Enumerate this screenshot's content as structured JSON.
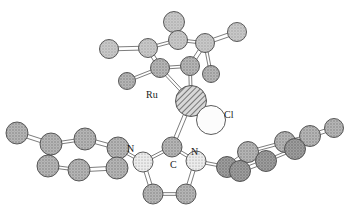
{
  "figure": {
    "type": "ball-and-stick crystal structure diagram",
    "background_color": "#ffffff",
    "bond_color": "#6e6e6e",
    "outline_color": "#4a4a4a"
  },
  "labels": {
    "ru": "Ru",
    "cl": "Cl",
    "n_left": "N",
    "c_carbene": "C",
    "n_right": "N"
  },
  "label_positions": {
    "ru": {
      "x": 146,
      "y": 90
    },
    "cl": {
      "x": 224,
      "y": 110
    },
    "n_left": {
      "x": 127,
      "y": 144
    },
    "c_carbene": {
      "x": 170,
      "y": 160
    },
    "n_right": {
      "x": 191,
      "y": 147
    }
  },
  "styles": {
    "ru_fill": "#cfcfcf",
    "ru_pattern": "diagonal-hatch",
    "cl_fill": "#fbfbfb",
    "cl_pattern": "plain",
    "n_fill": "#e3e3e3",
    "n_pattern": "fine-stipple",
    "c_fill": "#a8a8a8",
    "c_pattern": "coarse-stipple",
    "c_fill_light": "#c2c2c2"
  },
  "atoms": [
    {
      "id": "ru1",
      "element": "Ru",
      "x": 191,
      "y": 101,
      "r": 15.5,
      "style": "ru",
      "labelled": true
    },
    {
      "id": "cl1",
      "element": "Cl",
      "x": 211,
      "y": 120,
      "r": 14.5,
      "style": "cl",
      "labelled": true
    },
    {
      "id": "cy1",
      "element": "C",
      "x": 178,
      "y": 40,
      "r": 9.5,
      "style": "c_light",
      "labelled": false
    },
    {
      "id": "cy2",
      "element": "C",
      "x": 205,
      "y": 43,
      "r": 9.5,
      "style": "c_light",
      "labelled": false
    },
    {
      "id": "cy3",
      "element": "C",
      "x": 190,
      "y": 66,
      "r": 9.5,
      "style": "c_mid",
      "labelled": false
    },
    {
      "id": "cy4",
      "element": "C",
      "x": 160,
      "y": 68,
      "r": 9.5,
      "style": "c_mid",
      "labelled": false
    },
    {
      "id": "cy5",
      "element": "C",
      "x": 148,
      "y": 48,
      "r": 9.5,
      "style": "c_light",
      "labelled": false
    },
    {
      "id": "cy6",
      "element": "C",
      "x": 174,
      "y": 22,
      "r": 10.5,
      "style": "c_light",
      "labelled": false
    },
    {
      "id": "cy7",
      "element": "C",
      "x": 109,
      "y": 49,
      "r": 9.5,
      "style": "c_light",
      "labelled": false
    },
    {
      "id": "cy8",
      "element": "C",
      "x": 237,
      "y": 32,
      "r": 9.5,
      "style": "c_light",
      "labelled": false
    },
    {
      "id": "cy9",
      "element": "C",
      "x": 211,
      "y": 74,
      "r": 8.5,
      "style": "c_mid",
      "labelled": false
    },
    {
      "id": "cy10",
      "element": "C",
      "x": 127,
      "y": 81,
      "r": 8.5,
      "style": "c_mid",
      "labelled": false
    },
    {
      "id": "cb1",
      "element": "C",
      "x": 172,
      "y": 147,
      "r": 10.0,
      "style": "c_mid",
      "labelled": true
    },
    {
      "id": "nl1",
      "element": "N",
      "x": 143,
      "y": 162,
      "r": 10.0,
      "style": "n",
      "labelled": true
    },
    {
      "id": "nr1",
      "element": "N",
      "x": 196,
      "y": 161,
      "r": 10.0,
      "style": "n",
      "labelled": true
    },
    {
      "id": "im1",
      "element": "C",
      "x": 153,
      "y": 194,
      "r": 10.0,
      "style": "c_mid",
      "labelled": false
    },
    {
      "id": "im2",
      "element": "C",
      "x": 186,
      "y": 194,
      "r": 10.0,
      "style": "c_mid",
      "labelled": false
    },
    {
      "id": "ar1",
      "element": "C",
      "x": 118,
      "y": 148,
      "r": 11.0,
      "style": "c_mid",
      "labelled": false
    },
    {
      "id": "ar2",
      "element": "C",
      "x": 117,
      "y": 168,
      "r": 11.0,
      "style": "c_mid",
      "labelled": false
    },
    {
      "id": "ar3",
      "element": "C",
      "x": 85,
      "y": 139,
      "r": 11.0,
      "style": "c_mid",
      "labelled": false
    },
    {
      "id": "ar4",
      "element": "C",
      "x": 79,
      "y": 170,
      "r": 11.0,
      "style": "c_mid",
      "labelled": false
    },
    {
      "id": "ar5",
      "element": "C",
      "x": 51,
      "y": 144,
      "r": 11.0,
      "style": "c_mid",
      "labelled": false
    },
    {
      "id": "ar6",
      "element": "C",
      "x": 48,
      "y": 166,
      "r": 11.0,
      "style": "c_mid",
      "labelled": false
    },
    {
      "id": "ar7",
      "element": "C",
      "x": 17,
      "y": 133,
      "r": 11.0,
      "style": "c_mid",
      "labelled": false
    },
    {
      "id": "br1",
      "element": "C",
      "x": 227,
      "y": 167,
      "r": 10.5,
      "style": "c_dark",
      "labelled": false
    },
    {
      "id": "br2",
      "element": "C",
      "x": 240,
      "y": 171,
      "r": 10.5,
      "style": "c_dark",
      "labelled": false
    },
    {
      "id": "br3",
      "element": "C",
      "x": 248,
      "y": 152,
      "r": 10.5,
      "style": "c_mid",
      "labelled": false
    },
    {
      "id": "br4",
      "element": "C",
      "x": 266,
      "y": 161,
      "r": 10.5,
      "style": "c_dark",
      "labelled": false
    },
    {
      "id": "br5",
      "element": "C",
      "x": 285,
      "y": 142,
      "r": 10.5,
      "style": "c_mid",
      "labelled": false
    },
    {
      "id": "br6",
      "element": "C",
      "x": 295,
      "y": 149,
      "r": 10.5,
      "style": "c_dark",
      "labelled": false
    },
    {
      "id": "br7",
      "element": "C",
      "x": 310,
      "y": 136,
      "r": 10.5,
      "style": "c_mid",
      "labelled": false
    },
    {
      "id": "br8",
      "element": "C",
      "x": 334,
      "y": 128,
      "r": 9.5,
      "style": "c_mid",
      "labelled": false
    }
  ],
  "bonds": [
    {
      "from": "ru1",
      "to": "cb1",
      "order": "double"
    },
    {
      "from": "ru1",
      "to": "cl1",
      "order": "single"
    },
    {
      "from": "ru1",
      "to": "cy4",
      "order": "single"
    },
    {
      "from": "ru1",
      "to": "cy3",
      "order": "single"
    },
    {
      "from": "cy1",
      "to": "cy2",
      "order": "single"
    },
    {
      "from": "cy2",
      "to": "cy3",
      "order": "double"
    },
    {
      "from": "cy3",
      "to": "cy4",
      "order": "single"
    },
    {
      "from": "cy4",
      "to": "cy5",
      "order": "double"
    },
    {
      "from": "cy5",
      "to": "cy1",
      "order": "single"
    },
    {
      "from": "cy1",
      "to": "cy6",
      "order": "single"
    },
    {
      "from": "cy5",
      "to": "cy7",
      "order": "double"
    },
    {
      "from": "cy2",
      "to": "cy8",
      "order": "double"
    },
    {
      "from": "cy2",
      "to": "cy9",
      "order": "single"
    },
    {
      "from": "cy4",
      "to": "cy10",
      "order": "single"
    },
    {
      "from": "cb1",
      "to": "nl1",
      "order": "single"
    },
    {
      "from": "cb1",
      "to": "nr1",
      "order": "single"
    },
    {
      "from": "nl1",
      "to": "im1",
      "order": "double"
    },
    {
      "from": "im1",
      "to": "im2",
      "order": "single"
    },
    {
      "from": "im2",
      "to": "nr1",
      "order": "double"
    },
    {
      "from": "nl1",
      "to": "ar1",
      "order": "single"
    },
    {
      "from": "ar1",
      "to": "ar2",
      "order": "single"
    },
    {
      "from": "ar1",
      "to": "ar3",
      "order": "double"
    },
    {
      "from": "ar2",
      "to": "ar4",
      "order": "double"
    },
    {
      "from": "ar3",
      "to": "ar5",
      "order": "single"
    },
    {
      "from": "ar4",
      "to": "ar6",
      "order": "single"
    },
    {
      "from": "ar5",
      "to": "ar6",
      "order": "double"
    },
    {
      "from": "ar5",
      "to": "ar7",
      "order": "double"
    },
    {
      "from": "nr1",
      "to": "br1",
      "order": "single"
    },
    {
      "from": "br1",
      "to": "br2",
      "order": "single"
    },
    {
      "from": "br1",
      "to": "br3",
      "order": "double"
    },
    {
      "from": "br2",
      "to": "br4",
      "order": "double"
    },
    {
      "from": "br3",
      "to": "br5",
      "order": "single"
    },
    {
      "from": "br4",
      "to": "br6",
      "order": "single"
    },
    {
      "from": "br5",
      "to": "br6",
      "order": "double"
    },
    {
      "from": "br5",
      "to": "br7",
      "order": "single"
    },
    {
      "from": "br7",
      "to": "br8",
      "order": "double"
    }
  ]
}
